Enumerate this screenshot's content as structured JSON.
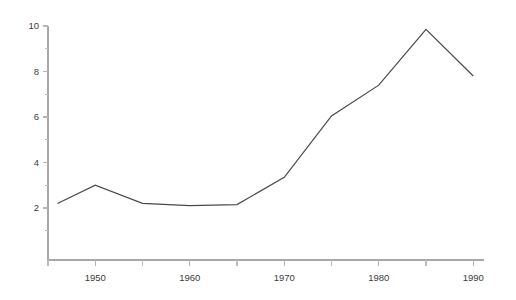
{
  "chart_data": {
    "type": "line",
    "title": "",
    "subtitle": "",
    "xlabel": "",
    "ylabel": "",
    "grid": false,
    "legend": null,
    "legend_position": "none",
    "xlim": [
      1945,
      1990
    ],
    "ylim": [
      0,
      10
    ],
    "x_ticks_major": [
      1950,
      1960,
      1970,
      1980,
      1990
    ],
    "x_tick_labels": [
      "1950",
      "1960",
      "1970",
      "1980",
      "1990"
    ],
    "x_ticks_minor": [
      1945,
      1955,
      1965,
      1975,
      1985
    ],
    "y_ticks_major": [
      2,
      4,
      6,
      8,
      10
    ],
    "y_tick_labels": [
      "2",
      "4",
      "6",
      "8",
      "10"
    ],
    "y_ticks_minor": [
      1,
      3,
      5,
      7,
      9
    ],
    "series": [
      {
        "name": "series-1",
        "color": "#4a4a4a",
        "x": [
          1946,
          1950,
          1955,
          1960,
          1965,
          1970,
          1975,
          1980,
          1985,
          1990
        ],
        "values": [
          2.2,
          3.0,
          2.2,
          2.1,
          2.15,
          3.35,
          6.05,
          7.4,
          9.85,
          7.8
        ]
      }
    ],
    "colors": {
      "line": "#4a4a4a",
      "axis": "#a8a8a8",
      "tick": "#b4b4b4",
      "label": "#3c3c3c",
      "background": "#ffffff"
    },
    "geometry": {
      "plot_left": 48,
      "plot_right": 484,
      "plot_top": 26,
      "plot_bottom": 260,
      "y_value_top": 10,
      "y_value_at_bottom": 0.0,
      "px_per_unit_y": 22.75,
      "x_year_left": 1945,
      "px_per_year": 9.45
    }
  }
}
